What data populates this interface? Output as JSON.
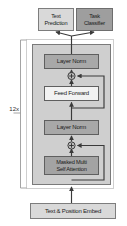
{
  "diagram": {
    "repeat_label": "12x",
    "colors": {
      "block_fill": "#cfcfcf",
      "norm_fill": "#a8a8a8",
      "feedforward_fill": "#f2f2f2",
      "attention_fill": "#a3a3a3",
      "head_light_fill": "#d9d9d9",
      "head_dark_fill": "#9e9e9e",
      "embed_fill": "#d9d9d9",
      "stroke": "#4a4a4a",
      "frame_stroke": "#cfcfcf",
      "background": "#ffffff"
    },
    "heads": [
      {
        "id": "text-prediction",
        "label": "Text\nPrediction"
      },
      {
        "id": "task-classifier",
        "label": "Task\nClassifier"
      }
    ],
    "layers": [
      {
        "id": "layer-norm-top",
        "label": "Layer Norm"
      },
      {
        "id": "feed-forward",
        "label": "Feed Forward"
      },
      {
        "id": "layer-norm-bottom",
        "label": "Layer Norm"
      },
      {
        "id": "masked-attention",
        "label": "Masked Multi\nSelf Attention"
      }
    ],
    "embedding": {
      "id": "text-position-embed",
      "label": "Text & Position Embed"
    },
    "residual_nodes": [
      {
        "id": "add-node-upper",
        "symbol": "+"
      },
      {
        "id": "add-node-lower",
        "symbol": "+"
      }
    ]
  }
}
